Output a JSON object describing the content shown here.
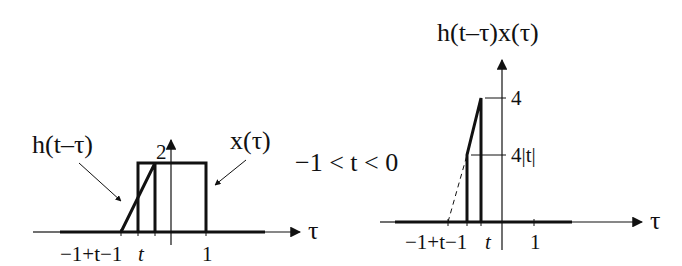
{
  "left_plot": {
    "labels": {
      "h_label": "h(t–τ)",
      "x_label": "x(τ)",
      "height_label": "2",
      "axis_label": "τ"
    },
    "ticks": {
      "t_minus_1": "−1+t−1",
      "t": "t",
      "one": "1"
    }
  },
  "condition": "−1 < t < 0",
  "right_plot": {
    "labels": {
      "title": "h(t–τ)x(τ)",
      "peak_label": "4",
      "step_label": "4|t|",
      "axis_label": "τ"
    },
    "ticks": {
      "t_minus_1": "−1+t−1",
      "t": "t",
      "one": "1"
    }
  },
  "colors": {
    "ink": "#111111",
    "background": "#ffffff"
  }
}
